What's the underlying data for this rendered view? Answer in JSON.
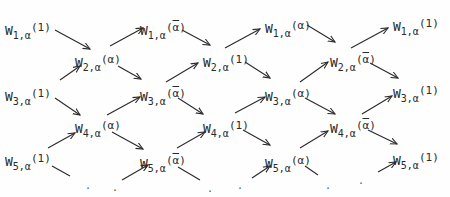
{
  "diagram": {
    "nodes": [
      {
        "id": "c0-w1",
        "w": "W",
        "index": "1",
        "sub_sep": ",",
        "sub_var": "α",
        "arg": "1",
        "bar": false,
        "x": 5,
        "y": 22
      },
      {
        "id": "c0-w3",
        "w": "W",
        "index": "3",
        "sub_sep": ",",
        "sub_var": "α",
        "arg": "1",
        "bar": false,
        "x": 5,
        "y": 88
      },
      {
        "id": "c0-w5",
        "w": "W",
        "index": "5",
        "sub_sep": ",",
        "sub_var": "α",
        "arg": "1",
        "bar": false,
        "x": 5,
        "y": 153
      },
      {
        "id": "c1-w2",
        "w": "W",
        "index": "2",
        "sub_sep": ",",
        "sub_var": "α",
        "arg": "α",
        "bar": false,
        "x": 75,
        "y": 54
      },
      {
        "id": "c1-w4",
        "w": "W",
        "index": "4",
        "sub_sep": ",",
        "sub_var": "α",
        "arg": "α",
        "bar": false,
        "x": 75,
        "y": 120
      },
      {
        "id": "c2-w1",
        "w": "W",
        "index": "1",
        "sub_sep": ",",
        "sub_var": "α",
        "arg": "α",
        "bar": true,
        "x": 140,
        "y": 22
      },
      {
        "id": "c2-w3",
        "w": "W",
        "index": "3",
        "sub_sep": ",",
        "sub_var": "α",
        "arg": "α",
        "bar": true,
        "x": 140,
        "y": 88
      },
      {
        "id": "c2-w5",
        "w": "W",
        "index": "5",
        "sub_sep": ",",
        "sub_var": "α",
        "arg": "α",
        "bar": true,
        "x": 140,
        "y": 155
      },
      {
        "id": "c3-w2",
        "w": "W",
        "index": "2",
        "sub_sep": ",",
        "sub_var": "α",
        "arg": "1",
        "bar": false,
        "x": 203,
        "y": 54
      },
      {
        "id": "c3-w4",
        "w": "W",
        "index": "4",
        "sub_sep": ",",
        "sub_var": "α",
        "arg": "1",
        "bar": false,
        "x": 203,
        "y": 120
      },
      {
        "id": "c4-w1",
        "w": "W",
        "index": "1",
        "sub_sep": ",",
        "sub_var": "α",
        "arg": "α",
        "bar": false,
        "x": 265,
        "y": 20
      },
      {
        "id": "c4-w3",
        "w": "W",
        "index": "3",
        "sub_sep": ",",
        "sub_var": "α",
        "arg": "α",
        "bar": false,
        "x": 265,
        "y": 88
      },
      {
        "id": "c4-w5",
        "w": "W",
        "index": "5",
        "sub_sep": ",",
        "sub_var": "α",
        "arg": "α",
        "bar": false,
        "x": 265,
        "y": 155
      },
      {
        "id": "c5-w2",
        "w": "W",
        "index": "2",
        "sub_sep": ",",
        "sub_var": "α",
        "arg": "α",
        "bar": true,
        "x": 330,
        "y": 54
      },
      {
        "id": "c5-w4",
        "w": "W",
        "index": "4",
        "sub_sep": ",",
        "sub_var": "α",
        "arg": "α",
        "bar": true,
        "x": 330,
        "y": 120
      },
      {
        "id": "c6-w1",
        "w": "W",
        "index": "1",
        "sub_sep": ",",
        "sub_var": "α",
        "arg": "1",
        "bar": false,
        "x": 393,
        "y": 18
      },
      {
        "id": "c6-w3",
        "w": "W",
        "index": "3",
        "sub_sep": ",",
        "sub_var": "α",
        "arg": "1",
        "bar": false,
        "x": 393,
        "y": 85
      },
      {
        "id": "c6-w5",
        "w": "W",
        "index": "5",
        "sub_sep": ",",
        "sub_var": "α",
        "arg": "1",
        "bar": false,
        "x": 393,
        "y": 152
      }
    ],
    "arrows": [
      {
        "from": "c0-w1",
        "to": "c1-w2",
        "x1": 55,
        "y1": 30,
        "x2": 90,
        "y2": 49
      },
      {
        "from": "c0-w3",
        "to": "c1-w2",
        "x1": 60,
        "y1": 80,
        "x2": 80,
        "y2": 66
      },
      {
        "from": "c0-w3",
        "to": "c1-w4",
        "x1": 55,
        "y1": 98,
        "x2": 80,
        "y2": 115
      },
      {
        "from": "c0-w5",
        "to": "c1-w4",
        "x1": 48,
        "y1": 148,
        "x2": 75,
        "y2": 133
      },
      {
        "from": "c0-w5",
        "to": "dots-1",
        "x1": 52,
        "y1": 166,
        "x2": 70,
        "y2": 176,
        "head": false
      },
      {
        "from": "c1-w2",
        "to": "c2-w1",
        "x1": 110,
        "y1": 46,
        "x2": 143,
        "y2": 28
      },
      {
        "from": "c1-w2",
        "to": "c2-w3",
        "x1": 118,
        "y1": 66,
        "x2": 141,
        "y2": 79
      },
      {
        "from": "c1-w4",
        "to": "c2-w3",
        "x1": 107,
        "y1": 115,
        "x2": 140,
        "y2": 97
      },
      {
        "from": "c1-w4",
        "to": "c2-w5",
        "x1": 112,
        "y1": 132,
        "x2": 143,
        "y2": 149
      },
      {
        "from": "dots-1",
        "to": "c2-w5",
        "x1": 122,
        "y1": 180,
        "x2": 148,
        "y2": 165
      },
      {
        "from": "c2-w1",
        "to": "c3-w2",
        "x1": 182,
        "y1": 30,
        "x2": 210,
        "y2": 45
      },
      {
        "from": "c2-w3",
        "to": "c3-w2",
        "x1": 166,
        "y1": 82,
        "x2": 198,
        "y2": 63
      },
      {
        "from": "c2-w3",
        "to": "c3-w4",
        "x1": 178,
        "y1": 98,
        "x2": 203,
        "y2": 114
      },
      {
        "from": "c2-w5",
        "to": "c3-w4",
        "x1": 177,
        "y1": 148,
        "x2": 205,
        "y2": 132
      },
      {
        "from": "c2-w5",
        "to": "dots-2",
        "x1": 178,
        "y1": 167,
        "x2": 200,
        "y2": 180,
        "head": false
      },
      {
        "from": "c3-w2",
        "to": "c4-w1",
        "x1": 225,
        "y1": 48,
        "x2": 260,
        "y2": 29
      },
      {
        "from": "c3-w2",
        "to": "c4-w3",
        "x1": 245,
        "y1": 62,
        "x2": 270,
        "y2": 78
      },
      {
        "from": "c3-w4",
        "to": "c4-w3",
        "x1": 235,
        "y1": 113,
        "x2": 265,
        "y2": 97
      },
      {
        "from": "c3-w4",
        "to": "c4-w5",
        "x1": 243,
        "y1": 130,
        "x2": 270,
        "y2": 145
      },
      {
        "from": "dots-2",
        "to": "c4-w5",
        "x1": 252,
        "y1": 178,
        "x2": 270,
        "y2": 166
      },
      {
        "from": "c4-w1",
        "to": "c5-w2",
        "x1": 307,
        "y1": 25,
        "x2": 335,
        "y2": 42
      },
      {
        "from": "c4-w3",
        "to": "c5-w2",
        "x1": 300,
        "y1": 82,
        "x2": 328,
        "y2": 62
      },
      {
        "from": "c4-w3",
        "to": "c5-w4",
        "x1": 305,
        "y1": 98,
        "x2": 335,
        "y2": 114
      },
      {
        "from": "c4-w5",
        "to": "c5-w4",
        "x1": 300,
        "y1": 148,
        "x2": 328,
        "y2": 131
      },
      {
        "from": "c4-w5",
        "to": "dots-3",
        "x1": 305,
        "y1": 166,
        "x2": 318,
        "y2": 175,
        "head": false
      },
      {
        "from": "c5-w2",
        "to": "c6-w1",
        "x1": 351,
        "y1": 48,
        "x2": 388,
        "y2": 28
      },
      {
        "from": "c5-w2",
        "to": "c6-w3",
        "x1": 370,
        "y1": 63,
        "x2": 398,
        "y2": 78
      },
      {
        "from": "c5-w4",
        "to": "c6-w3",
        "x1": 362,
        "y1": 114,
        "x2": 392,
        "y2": 96
      },
      {
        "from": "c5-w4",
        "to": "c6-w5",
        "x1": 368,
        "y1": 130,
        "x2": 397,
        "y2": 144
      },
      {
        "from": "dots-3",
        "to": "c6-w5",
        "x1": 378,
        "y1": 172,
        "x2": 396,
        "y2": 162
      }
    ],
    "dots": [
      {
        "id": "dots-1",
        "text": ".",
        "x": 85,
        "y": 180
      },
      {
        "id": "dots-1b",
        "text": ".",
        "x": 112,
        "y": 182
      },
      {
        "id": "dots-2",
        "text": ".",
        "x": 207,
        "y": 183
      },
      {
        "id": "dots-2b",
        "text": ".",
        "x": 237,
        "y": 180
      },
      {
        "id": "dots-3",
        "text": ".",
        "x": 325,
        "y": 180
      },
      {
        "id": "dots-3b",
        "text": ".",
        "x": 358,
        "y": 175
      }
    ]
  }
}
